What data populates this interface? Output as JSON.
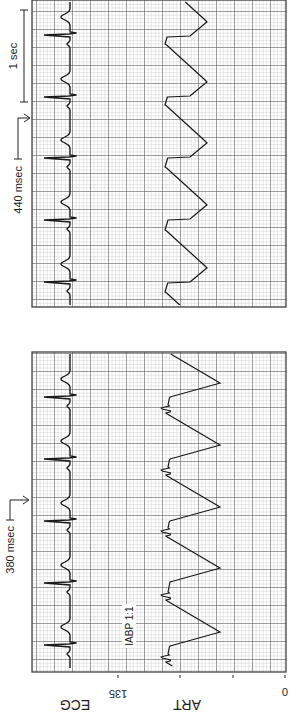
{
  "chart_data": {
    "type": "line",
    "title": "",
    "orientation_note": "figure rotated 90 degrees counter-clockwise",
    "axis_labels": {
      "ecg": "ECG",
      "art": "ART",
      "ticks": [
        "135",
        "",
        "",
        "0"
      ]
    },
    "panels": [
      {
        "name": "IABP 1:1",
        "annotation": "IABP 1:1",
        "interval_label": "380 msec",
        "series": [
          {
            "name": "ECG",
            "qrs_positions_px": [
              69,
              131,
              193,
              255,
              317
            ]
          },
          {
            "name": "ART",
            "peak_positions_px": [
              82,
              146,
              207,
              269,
              331
            ]
          }
        ]
      },
      {
        "name": "Off IABP",
        "interval_label": "440 msec",
        "scale_label": "1 sec",
        "series": [
          {
            "name": "ECG",
            "qrs_positions_px": [
              432,
              494,
              556,
              617,
              679
            ]
          },
          {
            "name": "ART",
            "peak_positions_px": [
              446,
              509,
              571,
              632,
              692
            ]
          }
        ]
      }
    ],
    "ylim": [
      0,
      135
    ],
    "grid": true
  },
  "colors": {
    "grid_minor": "#9a9a9a",
    "grid_major": "#4a4a4a",
    "trace": "#1a1a1a",
    "background": "#ffffff"
  }
}
